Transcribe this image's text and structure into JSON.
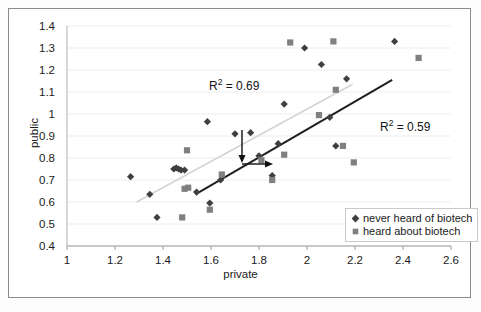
{
  "chart_data": {
    "type": "scatter",
    "title": "",
    "xlabel": "private",
    "ylabel": "public",
    "xlim": [
      1,
      2.6
    ],
    "ylim": [
      0.4,
      1.4
    ],
    "xticks": [
      "1",
      "1.2",
      "1.4",
      "1.6",
      "1.8",
      "2",
      "2.2",
      "2.4",
      "2.6"
    ],
    "yticks": [
      "0.4",
      "0.5",
      "0.6",
      "0.7",
      "0.8",
      "0.9",
      "1",
      "1.1",
      "1.2",
      "1.3",
      "1.4"
    ],
    "grid": "horizontal-light",
    "legend_position": "inside-bottom-right",
    "series": [
      {
        "name": "never heard of biotech",
        "marker": "diamond",
        "color": "#3f3f3f",
        "points": [
          [
            1.265,
            0.715
          ],
          [
            1.345,
            0.635
          ],
          [
            1.375,
            0.53
          ],
          [
            1.445,
            0.75
          ],
          [
            1.455,
            0.755
          ],
          [
            1.465,
            0.75
          ],
          [
            1.475,
            0.745
          ],
          [
            1.49,
            0.745
          ],
          [
            1.54,
            0.645
          ],
          [
            1.595,
            0.595
          ],
          [
            1.64,
            0.7
          ],
          [
            1.585,
            0.965
          ],
          [
            1.7,
            0.91
          ],
          [
            1.765,
            0.915
          ],
          [
            1.8,
            0.81
          ],
          [
            1.855,
            0.72
          ],
          [
            1.88,
            0.865
          ],
          [
            1.905,
            1.045
          ],
          [
            1.99,
            1.3
          ],
          [
            2.06,
            1.225
          ],
          [
            2.095,
            0.985
          ],
          [
            2.12,
            0.855
          ],
          [
            2.165,
            1.16
          ],
          [
            2.365,
            1.33
          ]
        ]
      },
      {
        "name": "heard about biotech",
        "marker": "square",
        "color": "#808080",
        "points": [
          [
            1.48,
            0.53
          ],
          [
            1.49,
            0.66
          ],
          [
            1.505,
            0.665
          ],
          [
            1.5,
            0.835
          ],
          [
            1.595,
            0.565
          ],
          [
            1.645,
            0.725
          ],
          [
            1.81,
            0.79
          ],
          [
            1.855,
            0.7
          ],
          [
            1.905,
            0.815
          ],
          [
            1.93,
            1.325
          ],
          [
            2.05,
            0.995
          ],
          [
            2.11,
            1.33
          ],
          [
            2.12,
            1.11
          ],
          [
            2.15,
            0.855
          ],
          [
            2.195,
            0.78
          ],
          [
            2.465,
            1.255
          ]
        ]
      }
    ],
    "trendlines": [
      {
        "name": "light-trendline",
        "color": "#d4d4d4",
        "r_squared": "0.69",
        "from": [
          1.29,
          0.6
        ],
        "to": [
          2.19,
          1.135
        ]
      },
      {
        "name": "dark-trendline",
        "color": "#1f1f1f",
        "r_squared": "0.59",
        "from": [
          1.535,
          0.635
        ],
        "to": [
          2.355,
          1.155
        ]
      }
    ],
    "annotations": [
      {
        "name": "r2-light-label",
        "text_prefix": "R",
        "text_sup": "2",
        "text_suffix": " = 0.69"
      },
      {
        "name": "r2-dark-label",
        "text_prefix": "R",
        "text_sup": "2",
        "text_suffix": " = 0.59"
      },
      {
        "name": "arrow-down",
        "type": "arrow",
        "direction": "down"
      },
      {
        "name": "arrow-right",
        "type": "arrow",
        "direction": "right"
      }
    ]
  },
  "legend": {
    "items": [
      {
        "marker": "diamond-marker-icon",
        "label": "never heard of biotech"
      },
      {
        "marker": "square-marker-icon",
        "label": "heard about biotech"
      }
    ]
  }
}
